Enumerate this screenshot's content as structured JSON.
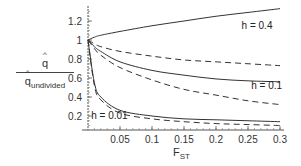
{
  "chart_data": {
    "type": "line",
    "title": "",
    "xlabel": "F_ST",
    "ylabel": "q̂ / q̂_undivided",
    "xlim": [
      0,
      0.3
    ],
    "ylim": [
      0.06,
      1.35
    ],
    "grid": false,
    "x_ticks": [
      "0.05",
      "0.1",
      "0.15",
      "0.2",
      "0.25",
      "0.3"
    ],
    "y_ticks": [
      "0.2",
      "0.4",
      "0.6",
      "0.8",
      "1",
      "1.2"
    ],
    "x": [
      0,
      0.01,
      0.02,
      0.05,
      0.1,
      0.15,
      0.2,
      0.25,
      0.3
    ],
    "series": [
      {
        "name": "h = 0.4 (solid)",
        "style": "solid",
        "values": [
          1.0,
          1.03,
          1.05,
          1.09,
          1.15,
          1.2,
          1.25,
          1.29,
          1.33
        ]
      },
      {
        "name": "h = 0.4 (dashed)",
        "style": "dashed",
        "values": [
          1.0,
          0.96,
          0.93,
          0.88,
          0.83,
          0.79,
          0.77,
          0.75,
          0.73
        ]
      },
      {
        "name": "h = 0.1 (solid)",
        "style": "solid",
        "values": [
          1.0,
          0.93,
          0.88,
          0.77,
          0.68,
          0.63,
          0.59,
          0.57,
          0.56
        ]
      },
      {
        "name": "h = 0.1 (dashed)",
        "style": "dashed",
        "values": [
          1.0,
          0.91,
          0.84,
          0.71,
          0.58,
          0.48,
          0.42,
          0.36,
          0.32
        ]
      },
      {
        "name": "h = 0.01 (solid)",
        "style": "solid",
        "values": [
          1.0,
          0.55,
          0.4,
          0.26,
          0.2,
          0.17,
          0.16,
          0.15,
          0.14
        ]
      },
      {
        "name": "h = 0.01 (dashed)",
        "style": "dashed",
        "values": [
          1.0,
          0.52,
          0.37,
          0.23,
          0.17,
          0.14,
          0.12,
          0.11,
          0.1
        ]
      }
    ],
    "annotations": [
      {
        "text": "h = 0.4",
        "x": 0.24,
        "y": 1.12
      },
      {
        "text": "h = 0.1",
        "x": 0.255,
        "y": 0.48
      },
      {
        "text": "h = 0.01",
        "x": 0.005,
        "y": 0.17
      }
    ]
  },
  "labels": {
    "y_num": "q",
    "y_den": "q",
    "y_den_sub": "undivided",
    "x_main": "F",
    "x_sub": "ST"
  }
}
